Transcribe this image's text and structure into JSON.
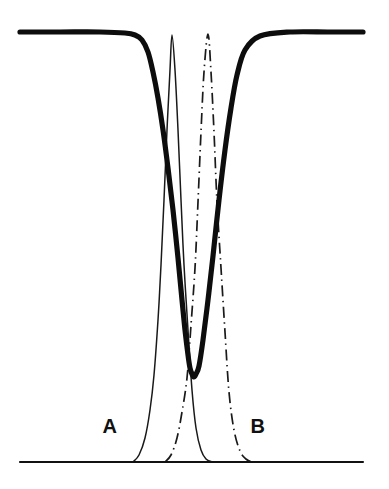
{
  "figure": {
    "background_color": "#ffffff",
    "ink_color": "#0d0d0d",
    "labels": {
      "curve_a": "A",
      "curve_b": "B"
    }
  },
  "chart_data": {
    "type": "line",
    "title": "",
    "subtitle": "",
    "xlabel": "",
    "ylabel": "",
    "xlim": [
      0,
      389
    ],
    "ylim": [
      0,
      489
    ],
    "grid": false,
    "legend": "inline-annotations",
    "axes": {
      "baseline_y": 462,
      "baseline_x_start": 20,
      "baseline_x_end": 363,
      "top_level_y": 32
    },
    "annotations": [
      {
        "text": "A",
        "x": 110,
        "y": 428,
        "refers_to": "thin-solid-gaussian-peak"
      },
      {
        "text": "B",
        "x": 258,
        "y": 428,
        "refers_to": "dash-dot-gaussian-peak"
      }
    ],
    "series": [
      {
        "name": "thick-dip-curve",
        "style": "solid-thick",
        "linewidth": 5.2,
        "color": "#0d0d0d",
        "description": "Broad flat plateau at top level that plunges to a deep narrow minimum near centre and recovers to the plateau",
        "x": [
          20,
          60,
          100,
          125,
          135,
          142,
          148,
          153,
          158,
          163,
          168,
          173,
          178,
          182,
          185,
          188,
          190,
          192,
          194,
          196,
          199,
          203,
          208,
          213,
          219,
          225,
          231,
          237,
          245,
          260,
          290,
          330,
          363
        ],
        "y": [
          32,
          32,
          32,
          33,
          35,
          40,
          52,
          72,
          98,
          130,
          168,
          210,
          258,
          300,
          330,
          355,
          368,
          374,
          377,
          374,
          366,
          340,
          300,
          256,
          200,
          150,
          108,
          75,
          50,
          36,
          32,
          32,
          32
        ]
      },
      {
        "name": "thin-gaussian-peak-A",
        "style": "solid-thin",
        "linewidth": 1.5,
        "color": "#191919",
        "peak_x": 172,
        "peak_y": 32,
        "baseline_y": 462,
        "left_foot_x": 133,
        "right_foot_x": 212,
        "description": "Narrow symmetric Gaussian peak labelled A, apex touching the top plateau level",
        "x": [
          133,
          139,
          145,
          150,
          154,
          158,
          161,
          164,
          167,
          170,
          172,
          175,
          178,
          181,
          184,
          188,
          192,
          196,
          201,
          206,
          212
        ],
        "y": [
          462,
          455,
          438,
          410,
          375,
          320,
          265,
          200,
          130,
          70,
          35,
          70,
          130,
          200,
          265,
          330,
          390,
          428,
          450,
          459,
          462
        ]
      },
      {
        "name": "dashdot-gaussian-peak-B",
        "style": "dash-dot",
        "linewidth": 1.7,
        "color": "#1a1a1a",
        "peak_x": 208,
        "peak_y": 32,
        "baseline_y": 462,
        "left_foot_x": 165,
        "right_foot_x": 252,
        "description": "Narrow symmetric Gaussian peak labelled B, drawn dash-dot, apex touching the top plateau level, shifted right of peak A",
        "x": [
          165,
          171,
          177,
          182,
          187,
          191,
          195,
          198,
          201,
          204,
          208,
          211,
          214,
          217,
          221,
          225,
          229,
          234,
          240,
          246,
          252
        ],
        "y": [
          462,
          455,
          438,
          412,
          378,
          325,
          268,
          202,
          132,
          72,
          34,
          72,
          132,
          202,
          268,
          332,
          392,
          430,
          451,
          459,
          462
        ]
      }
    ]
  }
}
